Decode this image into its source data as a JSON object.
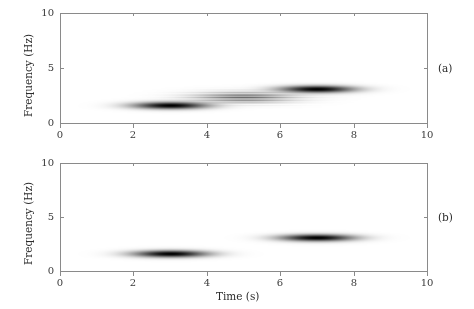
{
  "figure": {
    "background_color": "#ffffff",
    "axis_color": "#8a8a8a",
    "text_color": "#2b2b2b",
    "signal_color": "#000000"
  },
  "axes": {
    "xlabel": "Time (s)",
    "ylabel": "Frequency (Hz)",
    "xticks": [
      "0",
      "2",
      "4",
      "6",
      "8",
      "10"
    ],
    "yticks": [
      "0",
      "5",
      "10"
    ],
    "xlim": [
      0,
      10
    ],
    "ylim": [
      0,
      10
    ]
  },
  "panels": [
    {
      "label": "(a)"
    },
    {
      "label": "(b)"
    }
  ],
  "chart_data": [
    {
      "type": "heatmap",
      "panel": "(a)",
      "title": "",
      "xlabel": "Time (s)",
      "ylabel": "Frequency (Hz)",
      "xlim": [
        0,
        10
      ],
      "ylim": [
        0,
        10
      ],
      "xticks": [
        0,
        2,
        4,
        6,
        8,
        10
      ],
      "yticks": [
        0,
        5,
        10
      ],
      "grid": false,
      "colormap": "grayscale-inverted",
      "description": "Wigner-Ville style time-frequency distribution with auto-terms and oscillatory cross-terms",
      "components": [
        {
          "kind": "auto-term",
          "t_center": 3.0,
          "f_center": 1.6,
          "t_sigma": 0.62,
          "f_sigma": 0.2,
          "amplitude": 1.0
        },
        {
          "kind": "auto-term",
          "t_center": 7.0,
          "f_center": 3.1,
          "t_sigma": 0.62,
          "f_sigma": 0.2,
          "amplitude": 1.0
        },
        {
          "kind": "cross-term",
          "t_center": 5.0,
          "f_center": 2.35,
          "t_sigma": 0.82,
          "f_sigma": 0.3,
          "amplitude": 0.55,
          "oscillation_cycles_per_hz": 3.4,
          "note": "oscillating interference lobe midway between the two auto-terms"
        }
      ]
    },
    {
      "type": "heatmap",
      "panel": "(b)",
      "title": "",
      "xlabel": "Time (s)",
      "ylabel": "Frequency (Hz)",
      "xlim": [
        0,
        10
      ],
      "ylim": [
        0,
        10
      ],
      "xticks": [
        0,
        2,
        4,
        6,
        8,
        10
      ],
      "yticks": [
        0,
        5,
        10
      ],
      "grid": false,
      "colormap": "grayscale-inverted",
      "description": "Cross-term free time-frequency distribution showing only the two auto-terms",
      "components": [
        {
          "kind": "auto-term",
          "t_center": 3.0,
          "f_center": 1.6,
          "t_sigma": 0.62,
          "f_sigma": 0.2,
          "amplitude": 1.0
        },
        {
          "kind": "auto-term",
          "t_center": 7.0,
          "f_center": 3.1,
          "t_sigma": 0.62,
          "f_sigma": 0.2,
          "amplitude": 1.0
        }
      ]
    }
  ]
}
